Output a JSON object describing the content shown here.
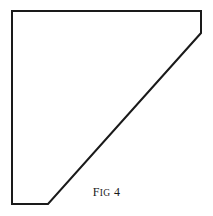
{
  "figure": {
    "caption_full": "Fig 4",
    "caption_lead": "F",
    "caption_small_caps": "IG",
    "caption_number": "4",
    "stroke_color": "#1a1a1a",
    "fill_color": "#ffffff",
    "background_color": "#ffffff",
    "stroke_width": 2,
    "shape_name": "pentagon-outline",
    "vertices": [
      {
        "label": "top-left",
        "x": 12,
        "y": 11
      },
      {
        "label": "top-right",
        "x": 201,
        "y": 11
      },
      {
        "label": "right-lower",
        "x": 201,
        "y": 33
      },
      {
        "label": "bottom-diagonal-end",
        "x": 48,
        "y": 204
      },
      {
        "label": "bottom-left",
        "x": 12,
        "y": 204
      }
    ],
    "edges": [
      {
        "name": "top-edge",
        "from": "top-left",
        "to": "top-right"
      },
      {
        "name": "right-edge",
        "from": "top-right",
        "to": "right-lower"
      },
      {
        "name": "diagonal-edge",
        "from": "right-lower",
        "to": "bottom-diagonal-end"
      },
      {
        "name": "bottom-edge",
        "from": "bottom-diagonal-end",
        "to": "bottom-left"
      },
      {
        "name": "left-edge",
        "from": "bottom-left",
        "to": "top-left"
      }
    ],
    "points_attr": "12,11 201,11 201,33 48,204 12,204"
  }
}
